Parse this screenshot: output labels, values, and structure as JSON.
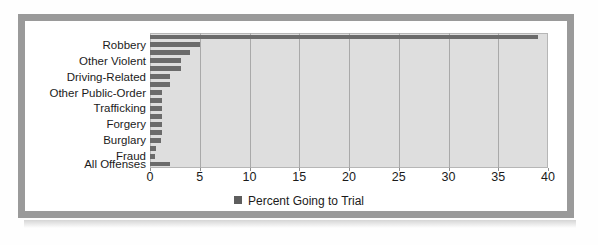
{
  "figure": {
    "frame_color": "#9a9a9a",
    "panel_color": "#dedede",
    "bar_color": "#6b6b6b",
    "gridline_color": "#a9a9a9"
  },
  "legend": {
    "label": "Percent Going to Trial",
    "swatch_color": "#5e5e5e",
    "position": "bottom-center"
  },
  "axis": {
    "x_ticks": [
      "0",
      "5",
      "10",
      "15",
      "20",
      "25",
      "30",
      "35",
      "40"
    ]
  },
  "chart_data": {
    "type": "bar",
    "orientation": "horizontal",
    "title": "",
    "subtitle": "",
    "xlabel": "",
    "ylabel": "",
    "xlim": [
      0,
      40
    ],
    "ylim": null,
    "grid": true,
    "legend_position": "bottom-center",
    "series": [
      {
        "name": "Percent Going to Trial",
        "color": "#6b6b6b",
        "values": [
          39,
          5,
          4,
          3.1,
          3.1,
          2,
          2,
          1.2,
          1.2,
          1.2,
          1.2,
          1.2,
          1.2,
          1.1,
          0.6,
          0.5,
          2
        ]
      }
    ],
    "categories": [
      "",
      "Robbery",
      "",
      "Other Violent",
      "",
      "Driving-Related",
      "",
      "Other Public-Order",
      "",
      "Trafficking",
      "",
      "Forgery",
      "",
      "Burglary",
      "",
      "Fraud",
      "All Offenses"
    ],
    "visible_tick_labels": [
      "Robbery",
      "Other Violent",
      "Driving-Related",
      "Other Public-Order",
      "Trafficking",
      "Forgery",
      "Burglary",
      "Fraud",
      "All Offenses"
    ]
  }
}
